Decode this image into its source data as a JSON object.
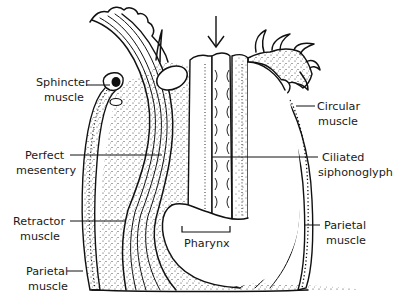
{
  "diagram": {
    "colors": {
      "ink": "#111111",
      "background": "#ffffff",
      "stipple": "#333333"
    },
    "labels": {
      "sphincter": [
        "Sphincter",
        "muscle"
      ],
      "perfect_mesentery": [
        "Perfect",
        "mesentery"
      ],
      "retractor": [
        "Retractor",
        "muscle"
      ],
      "parietal_left": [
        "Parietal",
        "muscle"
      ],
      "circular": [
        "Circular",
        "muscle"
      ],
      "siphonoglyph": [
        "Ciliated",
        "siphonoglyph"
      ],
      "parietal_right": [
        "Parietal",
        "muscle"
      ],
      "pharynx": "Pharynx"
    },
    "arrow": {
      "meaning": "water current into siphonoglyph",
      "direction": "down"
    }
  }
}
